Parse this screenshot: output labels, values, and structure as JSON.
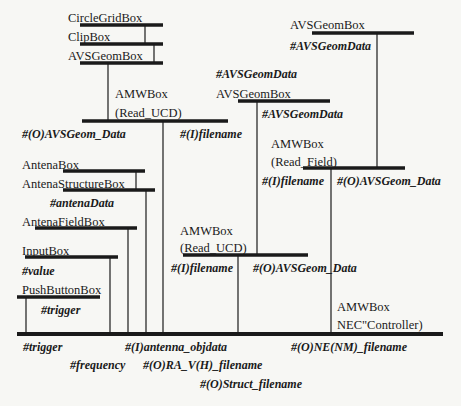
{
  "diagram": {
    "boxes": {
      "circle_grid": {
        "name": "CircleGridBox"
      },
      "clip": {
        "name": "ClipBox"
      },
      "avs_geom_left": {
        "name": "AVSGeomBox"
      },
      "amw_read_ucd_top": {
        "name": "AMWBox",
        "sub": "(Read_UCD)",
        "port_out": "#(O)AVSGeom_Data",
        "port_in": "#(I)filename"
      },
      "avs_geom_right_top": {
        "name": "AVSGeomBox",
        "port": "#AVSGeomData"
      },
      "avs_geom_middle": {
        "name": "AVSGeomBox",
        "port_above": "#AVSGeomData",
        "port_below": "#AVSGeomData"
      },
      "amw_read_field": {
        "name": "AMWBox",
        "sub": "(Read_Field)",
        "port_in": "#(I)filename",
        "port_out": "#(O)AVSGeom_Data"
      },
      "antena": {
        "name": "AntenaBox"
      },
      "antena_structure": {
        "name": "AntenaStructureBox",
        "port": "#antenaData"
      },
      "antena_field": {
        "name": "AntenaFieldBox"
      },
      "input": {
        "name": "InputBox",
        "port": "#value"
      },
      "push_button": {
        "name": "PushButtonBox",
        "port": "#trigger"
      },
      "amw_read_ucd_mid": {
        "name": "AMWBox",
        "sub": "(Read_UCD)",
        "port_in": "#(I)filename",
        "port_out": "#(O)AVSGeom_Data"
      },
      "amw_nec_controller": {
        "name": "AMWBox",
        "sub": "NEC\"Controller)"
      }
    },
    "bottom_ports": {
      "trigger": "#trigger",
      "frequency": "#frequency",
      "antenna_objdata": "#(I)antenna_objdata",
      "ra_vh_filename": "#(O)RA_V(H)_filename",
      "struct_filename": "#(O)Struct_filename",
      "ne_nm_filename": "#(O)NE(NM)_filename"
    },
    "colors": {
      "line": "#1a1a1a",
      "background": "#f7f7f4"
    }
  }
}
